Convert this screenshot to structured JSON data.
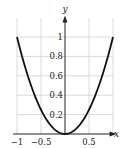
{
  "chart_data": {
    "type": "line",
    "title": "",
    "xlabel": "x",
    "ylabel": "y",
    "function": "y = x^2",
    "xlim": [
      -1,
      1
    ],
    "ylim": [
      0,
      1.2
    ],
    "x_ticks": [
      -1,
      -0.5,
      0.5
    ],
    "x_tick_labels": [
      "−1",
      "−0.5",
      "0.5"
    ],
    "y_ticks": [
      0.2,
      0.4,
      0.6,
      0.8,
      1
    ],
    "y_tick_labels": [
      "0.2",
      "0.4",
      "0.6",
      "0.8",
      "1"
    ],
    "grid": true,
    "series": [
      {
        "name": "x^2",
        "x": [
          -1,
          -0.75,
          -0.5,
          -0.25,
          0,
          0.25,
          0.5,
          0.75,
          1
        ],
        "values": [
          1,
          0.5625,
          0.25,
          0.0625,
          0,
          0.0625,
          0.25,
          0.5625,
          1
        ]
      }
    ],
    "colors": {
      "curve": "#111111",
      "grid": "#d0d0d0",
      "axis": "#222222"
    }
  }
}
